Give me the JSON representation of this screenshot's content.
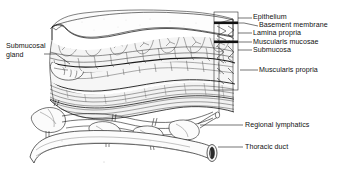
{
  "figure": {
    "style": "black-and-white pen-and-ink line drawing, cutaway block of tissue",
    "background_color": "#ffffff",
    "ink_color": "#1a1a1a",
    "fill_color": "#f7f7f7",
    "shade_color": "#e8e8e8"
  },
  "labels": {
    "epithelium": "Epithelium",
    "basement_membrane": "Basement membrane",
    "lamina_propria": "Lamina propria",
    "muscularis_mucosae": "Muscularis mucosae",
    "submucosa": "Submucosa",
    "muscularis_propria": "Muscularis propria",
    "regional_lymphatics": "Regional lymphatics",
    "thoracic_duct": "Thoracic duct",
    "submucosal_gland_line1": "Submucosal",
    "submucosal_gland_line2": "gland"
  },
  "layer_stack_top_to_bottom": [
    "Epithelium",
    "Basement membrane",
    "Lamina propria",
    "Muscularis mucosae",
    "Submucosa",
    "Muscularis propria"
  ],
  "structures": [
    "Submucosal gland",
    "Regional lymphatics",
    "Thoracic duct"
  ]
}
